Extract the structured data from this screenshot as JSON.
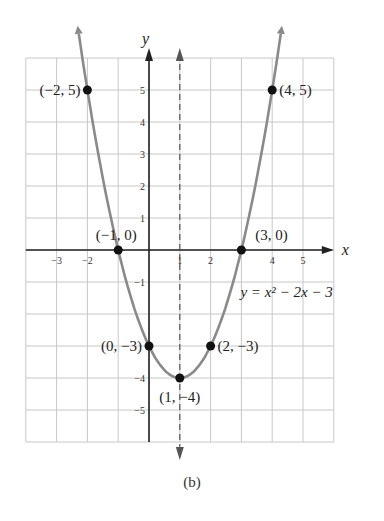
{
  "chart_data": {
    "type": "line",
    "title": "",
    "caption": "(b)",
    "xlabel": "x",
    "ylabel": "y",
    "xlim": [
      -4,
      6
    ],
    "ylim": [
      -6,
      6
    ],
    "grid": true,
    "x_ticks": [
      "-3",
      "-2",
      "1",
      "2",
      "4",
      "5"
    ],
    "y_ticks": [
      "5",
      "4",
      "3",
      "2",
      "1",
      "-1",
      "-4",
      "-5"
    ],
    "series": [
      {
        "name": "y = x^2 - 2x - 3",
        "equation_label": "y = x² − 2x − 3",
        "color": "#8a8a8a",
        "x": [
          -2,
          -1,
          0,
          1,
          2,
          3,
          4
        ],
        "y": [
          5,
          0,
          -3,
          -4,
          -3,
          0,
          5
        ]
      }
    ],
    "points": [
      {
        "x": -2,
        "y": 5,
        "label": "(−2, 5)"
      },
      {
        "x": 4,
        "y": 5,
        "label": "(4, 5)"
      },
      {
        "x": -1,
        "y": 0,
        "label": "(−1, 0)"
      },
      {
        "x": 3,
        "y": 0,
        "label": "(3, 0)"
      },
      {
        "x": 0,
        "y": -3,
        "label": "(0, −3)"
      },
      {
        "x": 2,
        "y": -3,
        "label": "(2, −3)"
      },
      {
        "x": 1,
        "y": -4,
        "label": "(1, −4)"
      }
    ],
    "axis_of_symmetry": {
      "x": 1,
      "style": "dashed"
    }
  }
}
